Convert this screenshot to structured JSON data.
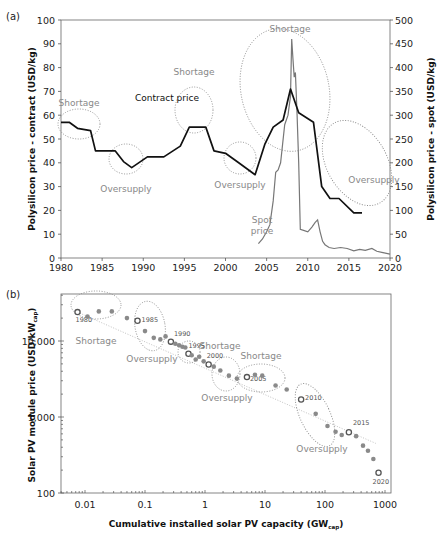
{
  "chart_data": [
    {
      "panel": "(a)",
      "type": "line",
      "title": "",
      "xlabel": "",
      "ylabel": "Polysilicon price - contract (USD/kg)",
      "ylabel_right": "Polysilicon price - spot (USD/kg)",
      "xlim": [
        1980,
        2020
      ],
      "ylim": [
        0,
        100
      ],
      "ylim_right": [
        0,
        500
      ],
      "x_ticks": [
        1980,
        1985,
        1990,
        1995,
        2000,
        2005,
        2010,
        2015,
        2020
      ],
      "y_ticks": [
        0,
        10,
        20,
        30,
        40,
        50,
        60,
        70,
        80,
        90,
        100
      ],
      "y_ticks_right": [
        0,
        50,
        100,
        150,
        200,
        250,
        300,
        350,
        400,
        450,
        500
      ],
      "grid": false,
      "series": [
        {
          "name": "Contract price",
          "axis": "left",
          "color": "#111111",
          "x": [
            1980,
            1981,
            1982,
            1983.6,
            1984.2,
            1986.6,
            1987.6,
            1988.6,
            1990.5,
            1992.5,
            1994.5,
            1995.6,
            1997.6,
            1998.6,
            2000,
            2001.6,
            2003.6,
            2004.8,
            2005.8,
            2007,
            2007.9,
            2008.9,
            2010.7,
            2011.7,
            2012.7,
            2013.8,
            2015.6,
            2016.6
          ],
          "values": [
            57,
            57,
            54.5,
            53.5,
            45,
            45,
            40.5,
            38,
            42.5,
            42.5,
            47,
            55,
            55,
            45,
            44,
            40,
            35,
            48,
            55,
            58,
            71,
            61,
            57,
            30,
            25,
            25,
            19,
            19
          ]
        },
        {
          "name": "Spot price",
          "axis": "right",
          "color": "#777777",
          "x": [
            2004,
            2004.5,
            2005,
            2005.4,
            2005.8,
            2006.1,
            2006.4,
            2006.7,
            2007.2,
            2007.6,
            2007.9,
            2008.05,
            2008.2,
            2008.35,
            2008.5,
            2008.7,
            2008.9,
            2009.1,
            2009.5,
            2010,
            2010.5,
            2010.9,
            2011.2,
            2011.5,
            2011.8,
            2012.1,
            2012.6,
            2013.2,
            2014,
            2014.8,
            2015.6,
            2016.3,
            2017,
            2017.8,
            2018.4,
            2019,
            2020
          ],
          "values": [
            30,
            40,
            55,
            70,
            120,
            180,
            185,
            200,
            280,
            300,
            340,
            460,
            420,
            380,
            390,
            300,
            200,
            60,
            58,
            55,
            65,
            75,
            80,
            55,
            35,
            28,
            22,
            20,
            22,
            20,
            15,
            18,
            16,
            20,
            14,
            12,
            8
          ]
        }
      ],
      "annotations": [
        {
          "text": "Shortage",
          "x": 1982.3,
          "y": 59,
          "type": "ellipse"
        },
        {
          "text": "Oversupply",
          "x": 1988.5,
          "y": 40,
          "type": "ellipse"
        },
        {
          "text": "Shortage",
          "x": 1996.6,
          "y": 54,
          "type": "ellipse"
        },
        {
          "text": "Oversupply",
          "x": 2002.5,
          "y": 38,
          "type": "ellipse"
        },
        {
          "text": "Shortage",
          "x": 2007.5,
          "y": 68,
          "type": "ellipse"
        },
        {
          "text": "Oversupply",
          "x": 2013.5,
          "y": 33,
          "type": "ellipse"
        },
        {
          "text": "Contract price",
          "x": 1989.5,
          "y": 52,
          "type": "label"
        },
        {
          "text": "Spot price",
          "x": 2006.2,
          "y": 12,
          "type": "label"
        }
      ]
    },
    {
      "panel": "(b)",
      "type": "scatter",
      "title": "",
      "xlabel": "Cumulative installed solar PV capacity (GW_cap)",
      "ylabel": "Solar PV module price (USD/kW_cap)",
      "xscale": "log",
      "yscale": "log",
      "xlim": [
        0.0037,
        1300
      ],
      "ylim": [
        100,
        40000
      ],
      "x_ticks": [
        "0.01",
        "0.1",
        "1",
        "10",
        "100",
        "1000"
      ],
      "y_ticks": [
        "100",
        "1,000",
        "10,000"
      ],
      "grid": false,
      "series": [
        {
          "name": "Module price (annual)",
          "color": "#8a8a8a",
          "points": [
            {
              "year": 1980,
              "x": 0.0075,
              "y": 24000,
              "labeled": true
            },
            {
              "year": 1981,
              "x": 0.011,
              "y": 21000
            },
            {
              "year": 1982,
              "x": 0.017,
              "y": 24500
            },
            {
              "year": 1983,
              "x": 0.028,
              "y": 24500
            },
            {
              "year": 1984,
              "x": 0.05,
              "y": 20000
            },
            {
              "year": 1985,
              "x": 0.075,
              "y": 18500,
              "labeled": true
            },
            {
              "year": 1986,
              "x": 0.1,
              "y": 13500
            },
            {
              "year": 1987,
              "x": 0.14,
              "y": 11000
            },
            {
              "year": 1988,
              "x": 0.18,
              "y": 10500
            },
            {
              "year": 1989,
              "x": 0.22,
              "y": 11500
            },
            {
              "year": 1990,
              "x": 0.27,
              "y": 9800,
              "labeled": true
            },
            {
              "year": 1991,
              "x": 0.32,
              "y": 9200
            },
            {
              "year": 1992,
              "x": 0.37,
              "y": 8800
            },
            {
              "year": 1993,
              "x": 0.42,
              "y": 8400
            },
            {
              "year": 1994,
              "x": 0.47,
              "y": 8200
            },
            {
              "year": 1995,
              "x": 0.53,
              "y": 6800,
              "labeled": true
            },
            {
              "year": 1996,
              "x": 0.6,
              "y": 6500
            },
            {
              "year": 1997,
              "x": 0.7,
              "y": 5700
            },
            {
              "year": 1998,
              "x": 0.8,
              "y": 6200
            },
            {
              "year": 1999,
              "x": 0.95,
              "y": 5400
            },
            {
              "year": 2000,
              "x": 1.15,
              "y": 4900,
              "labeled": true
            },
            {
              "year": 2001,
              "x": 1.4,
              "y": 4600
            },
            {
              "year": 2002,
              "x": 1.8,
              "y": 4100
            },
            {
              "year": 2003,
              "x": 2.5,
              "y": 3500
            },
            {
              "year": 2004,
              "x": 3.4,
              "y": 3200
            },
            {
              "year": 2005,
              "x": 5.0,
              "y": 3350,
              "labeled": true
            },
            {
              "year": 2006,
              "x": 6.8,
              "y": 3600
            },
            {
              "year": 2007,
              "x": 9.0,
              "y": 3500
            },
            {
              "year": 2008,
              "x": 15,
              "y": 2600
            },
            {
              "year": 2009,
              "x": 23,
              "y": 2300
            },
            {
              "year": 2010,
              "x": 40,
              "y": 1700,
              "labeled": true
            },
            {
              "year": 2011,
              "x": 70,
              "y": 1100
            },
            {
              "year": 2012,
              "x": 110,
              "y": 760
            },
            {
              "year": 2013,
              "x": 150,
              "y": 640
            },
            {
              "year": 2014,
              "x": 190,
              "y": 580
            },
            {
              "year": 2015,
              "x": 250,
              "y": 630,
              "labeled": true
            },
            {
              "year": 2016,
              "x": 330,
              "y": 560
            },
            {
              "year": 2017,
              "x": 430,
              "y": 420
            },
            {
              "year": 2018,
              "x": 520,
              "y": 360
            },
            {
              "year": 2019,
              "x": 640,
              "y": 280
            },
            {
              "year": 2020,
              "x": 780,
              "y": 185,
              "labeled": true
            }
          ]
        }
      ],
      "trendline": {
        "style": "dotted",
        "color": "#bbbbbb",
        "from": [
          0.0075,
          24000
        ],
        "to": [
          700,
          450
        ]
      },
      "annotations": [
        {
          "text": "Shortage",
          "type": "ellipse"
        },
        {
          "text": "Oversupply",
          "type": "ellipse"
        },
        {
          "text": "Shortage",
          "type": "ellipse"
        },
        {
          "text": "Oversupply",
          "type": "ellipse"
        },
        {
          "text": "Shortage",
          "type": "ellipse"
        },
        {
          "text": "Oversupply",
          "type": "ellipse"
        }
      ]
    }
  ],
  "figure": {
    "panel_a_label": "(a)",
    "panel_b_label": "(b)",
    "a_ylabel_left": "Polysilicon price - contract (USD/kg)",
    "a_ylabel_right": "Polysilicon price - spot (USD/kg)",
    "a_contract_label": "Contract price",
    "a_spot_label_1": "Spot",
    "a_spot_label_2": "price",
    "b_ylabel": "Solar PV module price (USD/kW",
    "b_ylabel_sub": "cap",
    "b_ylabel_end": ")",
    "b_xlabel": "Cumulative installed solar PV capacity (GW",
    "b_xlabel_sub": "cap",
    "b_xlabel_end": ")",
    "shortage": "Shortage",
    "oversupply": "Oversupply",
    "colors": {
      "contract": "#111111",
      "spot": "#777777",
      "points": "#8a8a8a",
      "annotation": "#888888",
      "axis": "#555555"
    }
  }
}
